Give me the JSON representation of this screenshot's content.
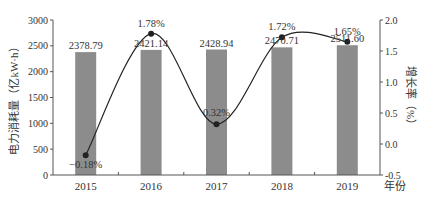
{
  "chart_data": {
    "type": "bar+line",
    "title": "",
    "categories": [
      "2015",
      "2016",
      "2017",
      "2018",
      "2019"
    ],
    "xlabel": "年份",
    "ylabel_left": "电力消耗量（亿kW·h）",
    "ylabel_right": "增长率（%）",
    "ylim_left": [
      0,
      3000
    ],
    "ylim_right": [
      -0.5,
      2.0
    ],
    "yticks_left": [
      "0",
      "500",
      "1000",
      "1500",
      "2000",
      "2500",
      "3000"
    ],
    "yticks_right": [
      "-0.5",
      "0.0",
      "0.5",
      "1.0",
      "1.5",
      "2.0"
    ],
    "grid": false,
    "legend": "none",
    "series": [
      {
        "name": "电力消耗量",
        "type": "bar",
        "axis": "left",
        "values": [
          2378.79,
          2421.14,
          2428.94,
          2470.71,
          2511.6
        ],
        "labels": [
          "2378.79",
          "2421.14",
          "2428.94",
          "2470.71",
          "2511.60"
        ],
        "color": "#8c8c8c"
      },
      {
        "name": "增长率",
        "type": "line",
        "smooth": true,
        "axis": "right",
        "values": [
          -0.18,
          1.78,
          0.32,
          1.72,
          1.65
        ],
        "labels": [
          "−0.18%",
          "1.78%",
          "0.32%",
          "1.72%",
          "1.65%"
        ],
        "color": "#222222"
      }
    ]
  }
}
